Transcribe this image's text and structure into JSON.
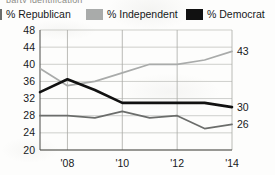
{
  "clipped_headline_text": "party identification",
  "legend": {
    "entries": [
      {
        "label": "% Republican",
        "color": "#6b6d6b",
        "swatch_name": "legend-swatch-republican"
      },
      {
        "label": "% Independent",
        "color": "#a9abaa",
        "swatch_name": "legend-swatch-independent"
      },
      {
        "label": "% Democrat",
        "color": "#111111",
        "swatch_name": "legend-swatch-democrat"
      }
    ]
  },
  "chart_data": {
    "type": "line",
    "title": "",
    "subtitle": "",
    "xlabel": "",
    "ylabel": "",
    "grid": true,
    "legend_position": "top",
    "x": [
      2007,
      2008,
      2009,
      2010,
      2011,
      2012,
      2013,
      2014
    ],
    "xtick_values": [
      2008,
      2010,
      2012,
      2014
    ],
    "xtick_labels": [
      "'08",
      "'10",
      "'12",
      "'14"
    ],
    "xlim": [
      2007,
      2014
    ],
    "ylim": [
      20,
      48
    ],
    "ytick_labels": [
      "48",
      "44",
      "40",
      "36",
      "32",
      "28",
      "24",
      "20"
    ],
    "ytick_values": [
      48,
      44,
      40,
      36,
      32,
      28,
      24,
      20
    ],
    "series": [
      {
        "name": "% Independent",
        "color": "#a9abaa",
        "values": [
          39,
          35,
          36,
          38,
          40,
          40,
          41,
          43
        ],
        "end_label": "43"
      },
      {
        "name": "% Democrat",
        "color": "#111111",
        "values": [
          33.5,
          36.5,
          34,
          31,
          31,
          31,
          31,
          30
        ],
        "end_label": "30"
      },
      {
        "name": "% Republican",
        "color": "#6b6d6b",
        "values": [
          28,
          28,
          27.5,
          29,
          27.5,
          28,
          25,
          26
        ],
        "end_label": "26"
      }
    ]
  }
}
